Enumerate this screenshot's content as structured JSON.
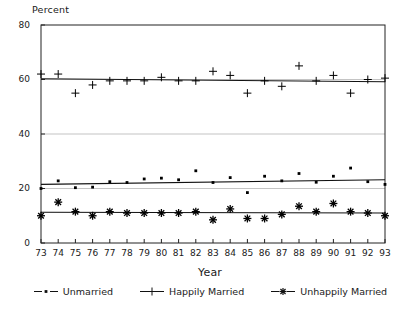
{
  "chart_data": {
    "type": "scatter",
    "title": "",
    "xlabel": "Year",
    "ylabel": "Percent",
    "ylim": [
      0,
      80
    ],
    "yticks": [
      0,
      20,
      40,
      60,
      80
    ],
    "grid": true,
    "legend_position": "bottom",
    "x": [
      73,
      74,
      75,
      76,
      77,
      78,
      79,
      80,
      81,
      82,
      83,
      84,
      85,
      86,
      87,
      88,
      89,
      90,
      91,
      92,
      93
    ],
    "categories": [
      "73",
      "74",
      "75",
      "76",
      "77",
      "78",
      "79",
      "80",
      "81",
      "82",
      "83",
      "84",
      "85",
      "86",
      "87",
      "88",
      "89",
      "90",
      "91",
      "92",
      "93"
    ],
    "series": [
      {
        "name": "Unmarried",
        "marker": "square",
        "color": "#000000",
        "values": [
          20.0,
          22.8,
          20.3,
          20.5,
          22.5,
          22.2,
          23.5,
          23.8,
          23.2,
          26.5,
          22.2,
          24.0,
          18.5,
          24.5,
          22.8,
          25.5,
          22.3,
          24.5,
          27.5,
          22.5,
          21.5
        ],
        "trend_start": 21.5,
        "trend_end": 23.2
      },
      {
        "name": "Happily Married",
        "marker": "plus",
        "color": "#000000",
        "values": [
          62.0,
          62.0,
          55.0,
          58.0,
          59.5,
          59.5,
          59.5,
          60.8,
          59.5,
          59.5,
          63.0,
          61.5,
          55.0,
          59.5,
          57.5,
          65.0,
          59.5,
          61.5,
          55.0,
          60.0,
          60.5
        ],
        "trend_start": 60.3,
        "trend_end": 59.2
      },
      {
        "name": "Unhappily Married",
        "marker": "asterisk",
        "color": "#000000",
        "values": [
          10.0,
          15.0,
          11.5,
          10.0,
          11.5,
          11.0,
          11.0,
          11.0,
          11.0,
          11.5,
          8.5,
          12.5,
          9.0,
          9.0,
          10.5,
          13.5,
          11.5,
          14.5,
          11.5,
          11.0,
          10.0
        ]
      }
    ],
    "trend_unhappily": {
      "start": 11.3,
      "end": 11.0
    }
  },
  "legend": {
    "entries": [
      {
        "label": "Unmarried",
        "key": "square-line-key"
      },
      {
        "label": "Happily Married",
        "key": "plus-line-key"
      },
      {
        "label": "Unhappily Married",
        "key": "asterisk-line-key"
      }
    ]
  }
}
